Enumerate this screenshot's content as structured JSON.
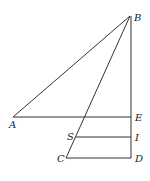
{
  "diagram": {
    "type": "geometry",
    "points": {
      "A": {
        "label": "A",
        "x": 13,
        "y": 117
      },
      "B": {
        "label": "B",
        "x": 130,
        "y": 16
      },
      "C": {
        "label": "C",
        "x": 66,
        "y": 158
      },
      "D": {
        "label": "D",
        "x": 131,
        "y": 158
      },
      "E": {
        "label": "E",
        "x": 131,
        "y": 117
      },
      "S": {
        "label": "S",
        "x": 76,
        "y": 137
      },
      "I": {
        "label": "I",
        "x": 131,
        "y": 137
      }
    },
    "segments": [
      "AB",
      "BC",
      "BD",
      "AE",
      "SI",
      "CD"
    ],
    "colors": {
      "line": "#333333",
      "label": "#222222"
    }
  }
}
